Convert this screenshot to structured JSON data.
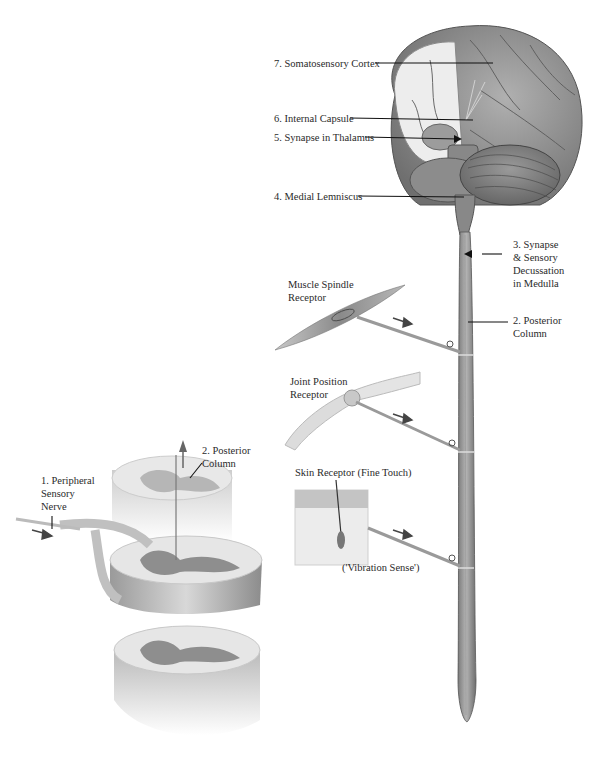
{
  "labels": {
    "cortex": "7. Somatosensory Cortex",
    "internal_capsule": "6. Internal Capsule",
    "thalamus": "5. Synapse in Thalamus",
    "medial_lemniscus": "4. Medial Lemniscus",
    "medulla": "3. Synapse\n& Sensory\nDecussation\nin Medulla",
    "posterior_column_right": "2. Posterior\nColumn",
    "muscle_spindle": "Muscle Spindle\nReceptor",
    "joint_position": "Joint Position\nReceptor",
    "skin_receptor": "Skin Receptor (Fine Touch)",
    "vibration": "('Vibration Sense')",
    "peripheral_nerve": "1. Peripheral\nSensory\nNerve",
    "posterior_column_left": "2. Posterior\nColumn"
  },
  "colors": {
    "background": "#ffffff",
    "tissue_dark": "#8a8a8a",
    "tissue_mid": "#a8a8a8",
    "tissue_light": "#d6d6d6",
    "white_matter": "#ececec",
    "leader_line": "#111111"
  }
}
